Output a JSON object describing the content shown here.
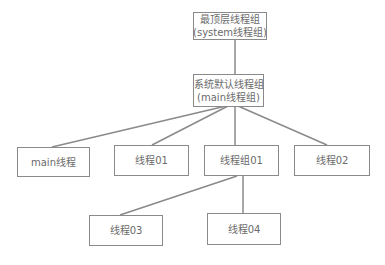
{
  "diagram": {
    "type": "tree",
    "colors": {
      "border": "#8a8a8a",
      "text": "#6a6a6a",
      "background": "#ffffff"
    },
    "nodes": {
      "system_group": {
        "line1": "最顶层线程组",
        "line2": "(system线程组)"
      },
      "main_group": {
        "line1": "系统默认线程组",
        "line2": "(main线程组)"
      },
      "main_thread": {
        "label": "main线程"
      },
      "thread01": {
        "label": "线程01"
      },
      "group01": {
        "label": "线程组01"
      },
      "thread02": {
        "label": "线程02"
      },
      "thread03": {
        "label": "线程03"
      },
      "thread04": {
        "label": "线程04"
      }
    },
    "edges": [
      [
        "system_group",
        "main_group"
      ],
      [
        "main_group",
        "main_thread"
      ],
      [
        "main_group",
        "thread01"
      ],
      [
        "main_group",
        "group01"
      ],
      [
        "main_group",
        "thread02"
      ],
      [
        "group01",
        "thread03"
      ],
      [
        "group01",
        "thread04"
      ]
    ]
  }
}
